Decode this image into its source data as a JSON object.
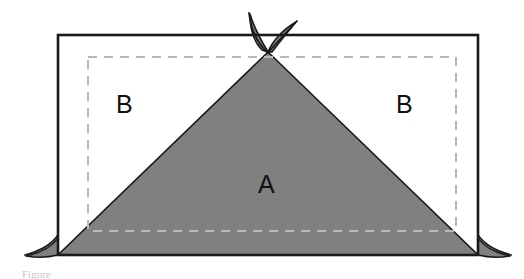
{
  "figure": {
    "type": "geometry-diagram",
    "canvas": {
      "width": 524,
      "height": 279,
      "background": "#ffffff"
    },
    "colors": {
      "fill_gray": "#808080",
      "outline_black": "#1a1a1a",
      "dashed_gray": "#b9b9b9",
      "page_white": "#ffffff",
      "caption_gray": "#c9c9c9"
    },
    "solid_rectangle": {
      "name": "outer-rectangle",
      "left": 58,
      "top": 35,
      "right": 478,
      "bottom": 255,
      "stroke": "#1a1a1a",
      "stroke_width": 2.5
    },
    "dashed_rectangle": {
      "name": "inner-dashed-rectangle",
      "left": 88,
      "top": 57,
      "right": 456,
      "bottom": 231,
      "stroke": "#b9b9b9",
      "stroke_width": 2,
      "dash_pattern": "9 7"
    },
    "triangle": {
      "name": "shaded-triangle",
      "apex": {
        "x": 268,
        "y": 52
      },
      "base_left": {
        "x": 58,
        "y": 255
      },
      "base_right": {
        "x": 478,
        "y": 255
      },
      "fill": "#808080",
      "stroke": "#1a1a1a"
    },
    "petals": {
      "name": "apex-petals",
      "count": 2,
      "fill": "#808080",
      "stroke": "#1a1a1a"
    },
    "tails": {
      "name": "base-corner-tails",
      "count": 2,
      "fill": "#808080",
      "stroke": "#1a1a1a"
    },
    "labels": {
      "b_left": "B",
      "b_right": "B",
      "a_center": "A"
    },
    "caption": "Figure"
  }
}
